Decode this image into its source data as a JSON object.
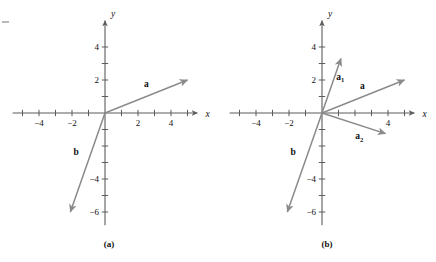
{
  "figure": {
    "edge_mark": "",
    "panels": [
      {
        "caption": "(a)",
        "origin": {
          "x": 105,
          "y": 113
        },
        "unit_px": 16.5,
        "axis_labels": {
          "x": "x",
          "y": "y"
        },
        "x_ticks": [
          -5,
          -4,
          -3,
          -2,
          -1,
          1,
          2,
          3,
          4,
          5
        ],
        "y_ticks": [
          1,
          2,
          3,
          4,
          -1,
          -2,
          -3,
          -4,
          -5,
          -6
        ],
        "x_tick_labels": [
          {
            "value": -4,
            "text": "−4"
          },
          {
            "value": -2,
            "text": "−2"
          },
          {
            "value": 2,
            "text": "2"
          },
          {
            "value": 4,
            "text": "4"
          }
        ],
        "y_tick_labels": [
          {
            "value": 4,
            "text": "4"
          },
          {
            "value": 2,
            "text": "2"
          },
          {
            "value": -4,
            "text": "−4"
          },
          {
            "value": -6,
            "text": "−6"
          }
        ],
        "x_range": [
          -5.6,
          5.6
        ],
        "y_range": [
          -6.8,
          5.6
        ],
        "vectors": [
          {
            "name": "a",
            "label": "a",
            "sub": "",
            "from": [
              0,
              0
            ],
            "to": [
              5.0,
              2.0
            ],
            "label_at": [
              2.5,
              1.55
            ]
          },
          {
            "name": "b",
            "label": "b",
            "sub": "",
            "from": [
              0,
              0
            ],
            "to": [
              -2.1,
              -6.0
            ],
            "label_at": [
              -1.75,
              -2.55
            ]
          }
        ]
      },
      {
        "caption": "(b)",
        "origin": {
          "x": 104,
          "y": 113
        },
        "unit_px": 16.5,
        "axis_labels": {
          "x": "x",
          "y": "y"
        },
        "x_ticks": [
          -5,
          -4,
          -3,
          -2,
          -1,
          1,
          2,
          3,
          4,
          5
        ],
        "y_ticks": [
          1,
          2,
          3,
          4,
          -1,
          -2,
          -3,
          -4,
          -5,
          -6
        ],
        "x_tick_labels": [
          {
            "value": -4,
            "text": "−4"
          },
          {
            "value": -2,
            "text": "−2"
          },
          {
            "value": 4,
            "text": "4"
          }
        ],
        "y_tick_labels": [
          {
            "value": 4,
            "text": "4"
          },
          {
            "value": 2,
            "text": "2"
          },
          {
            "value": -4,
            "text": "−4"
          },
          {
            "value": -6,
            "text": "−6"
          }
        ],
        "x_range": [
          -5.6,
          5.6
        ],
        "y_range": [
          -6.8,
          5.6
        ],
        "vectors": [
          {
            "name": "a",
            "label": "a",
            "sub": "",
            "from": [
              0,
              0
            ],
            "to": [
              5.0,
              2.0
            ],
            "label_at": [
              2.45,
              1.45
            ]
          },
          {
            "name": "a1",
            "label": "a",
            "sub": "1",
            "from": [
              0,
              0
            ],
            "to": [
              1.15,
              3.3
            ],
            "label_at": [
              1.1,
              2.0
            ]
          },
          {
            "name": "a2",
            "label": "a",
            "sub": "2",
            "from": [
              0,
              0
            ],
            "to": [
              3.85,
              -1.25
            ],
            "label_at": [
              2.25,
              -1.6
            ]
          },
          {
            "name": "b",
            "label": "b",
            "sub": "",
            "from": [
              0,
              0
            ],
            "to": [
              -2.1,
              -6.0
            ],
            "label_at": [
              -1.75,
              -2.55
            ]
          }
        ]
      }
    ],
    "colors": {
      "axis": "#5d5d5d",
      "vector": "#8a8a8a",
      "text": "#111111",
      "background": "#ffffff"
    }
  }
}
